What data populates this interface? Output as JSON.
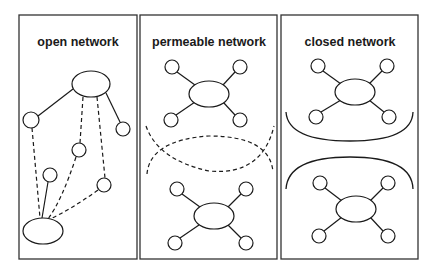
{
  "diagram": {
    "panels": [
      {
        "id": "open",
        "title": "open network",
        "x": 19,
        "y": 15,
        "w": 118,
        "h": 244
      },
      {
        "id": "permeable",
        "title": "permeable network",
        "x": 140,
        "y": 15,
        "w": 137,
        "h": 244
      },
      {
        "id": "closed",
        "title": "closed network",
        "x": 281,
        "y": 15,
        "w": 137,
        "h": 244
      }
    ],
    "colors": {
      "stroke": "#1a1a1a",
      "border": "#333333",
      "background": "#ffffff"
    }
  }
}
